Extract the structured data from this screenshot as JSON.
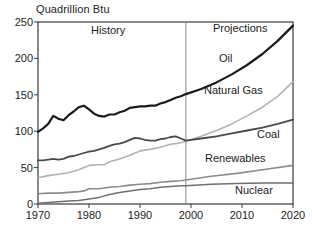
{
  "chart_data": {
    "type": "line",
    "title": "Quadrillion Btu",
    "ylabel": "Quadrillion Btu",
    "xlabel": "",
    "xlim": [
      1970,
      2020
    ],
    "ylim": [
      0,
      250
    ],
    "x_ticks": [
      "1970",
      "1980",
      "1990",
      "2000",
      "2010",
      "2020"
    ],
    "y_ticks": [
      "0",
      "50",
      "100",
      "150",
      "200",
      "250"
    ],
    "grid": false,
    "legend": "inline-labels",
    "divider_year": 1999,
    "regions": {
      "left": "History",
      "right": "Projections"
    },
    "axis_color": "#3a3a3a",
    "divider_color": "#848484",
    "series": [
      {
        "name": "Oil",
        "color": "#1a1a1a",
        "width": 2.2,
        "points": [
          [
            1970,
            99
          ],
          [
            1971,
            104
          ],
          [
            1972,
            110
          ],
          [
            1973,
            121
          ],
          [
            1974,
            117
          ],
          [
            1975,
            115
          ],
          [
            1976,
            122
          ],
          [
            1977,
            127
          ],
          [
            1978,
            133
          ],
          [
            1979,
            135
          ],
          [
            1980,
            130
          ],
          [
            1981,
            124
          ],
          [
            1982,
            121
          ],
          [
            1983,
            120
          ],
          [
            1984,
            123
          ],
          [
            1985,
            123
          ],
          [
            1986,
            126
          ],
          [
            1987,
            128
          ],
          [
            1988,
            132
          ],
          [
            1989,
            133
          ],
          [
            1990,
            134
          ],
          [
            1991,
            134
          ],
          [
            1992,
            135
          ],
          [
            1993,
            135
          ],
          [
            1994,
            138
          ],
          [
            1995,
            140
          ],
          [
            1996,
            143
          ],
          [
            1997,
            146
          ],
          [
            1998,
            148
          ],
          [
            1999,
            151
          ],
          [
            2002,
            158
          ],
          [
            2005,
            167
          ],
          [
            2008,
            178
          ],
          [
            2011,
            191
          ],
          [
            2014,
            206
          ],
          [
            2017,
            224
          ],
          [
            2020,
            245
          ]
        ]
      },
      {
        "name": "Natural Gas",
        "color": "#b3b3b3",
        "width": 1.6,
        "points": [
          [
            1970,
            36
          ],
          [
            1972,
            39
          ],
          [
            1974,
            41
          ],
          [
            1976,
            43
          ],
          [
            1978,
            47
          ],
          [
            1980,
            53
          ],
          [
            1982,
            54
          ],
          [
            1983,
            54
          ],
          [
            1984,
            58
          ],
          [
            1986,
            62
          ],
          [
            1988,
            67
          ],
          [
            1990,
            73
          ],
          [
            1992,
            75
          ],
          [
            1994,
            78
          ],
          [
            1996,
            82
          ],
          [
            1997,
            83
          ],
          [
            1998,
            84
          ],
          [
            1999,
            86
          ],
          [
            2002,
            93
          ],
          [
            2005,
            101
          ],
          [
            2008,
            110
          ],
          [
            2011,
            121
          ],
          [
            2014,
            133
          ],
          [
            2017,
            148
          ],
          [
            2020,
            168
          ]
        ]
      },
      {
        "name": "Coal",
        "color": "#4a4a4a",
        "width": 1.8,
        "points": [
          [
            1970,
            60
          ],
          [
            1971,
            60
          ],
          [
            1972,
            61
          ],
          [
            1973,
            62
          ],
          [
            1974,
            61
          ],
          [
            1975,
            62
          ],
          [
            1976,
            65
          ],
          [
            1977,
            66
          ],
          [
            1978,
            68
          ],
          [
            1979,
            70
          ],
          [
            1980,
            72
          ],
          [
            1981,
            73
          ],
          [
            1982,
            75
          ],
          [
            1983,
            77
          ],
          [
            1984,
            80
          ],
          [
            1985,
            82
          ],
          [
            1986,
            83
          ],
          [
            1987,
            85
          ],
          [
            1988,
            88
          ],
          [
            1989,
            91
          ],
          [
            1990,
            90
          ],
          [
            1991,
            88
          ],
          [
            1992,
            87
          ],
          [
            1993,
            87
          ],
          [
            1994,
            89
          ],
          [
            1995,
            90
          ],
          [
            1996,
            92
          ],
          [
            1997,
            93
          ],
          [
            1998,
            90
          ],
          [
            1999,
            87
          ],
          [
            2002,
            90
          ],
          [
            2005,
            93
          ],
          [
            2008,
            97
          ],
          [
            2011,
            101
          ],
          [
            2014,
            105
          ],
          [
            2017,
            110
          ],
          [
            2020,
            116
          ]
        ]
      },
      {
        "name": "Renewables",
        "color": "#8c8c8c",
        "width": 1.6,
        "points": [
          [
            1970,
            14
          ],
          [
            1972,
            15
          ],
          [
            1974,
            15
          ],
          [
            1976,
            16
          ],
          [
            1978,
            17
          ],
          [
            1979,
            18
          ],
          [
            1980,
            21
          ],
          [
            1982,
            21
          ],
          [
            1984,
            23
          ],
          [
            1986,
            24
          ],
          [
            1988,
            26
          ],
          [
            1990,
            27
          ],
          [
            1992,
            28
          ],
          [
            1994,
            30
          ],
          [
            1996,
            31
          ],
          [
            1998,
            32
          ],
          [
            1999,
            33
          ],
          [
            2004,
            38
          ],
          [
            2009,
            42
          ],
          [
            2014,
            47
          ],
          [
            2020,
            53
          ]
        ]
      },
      {
        "name": "Nuclear",
        "color": "#707070",
        "width": 1.5,
        "points": [
          [
            1970,
            1
          ],
          [
            1972,
            2
          ],
          [
            1974,
            3
          ],
          [
            1976,
            4
          ],
          [
            1978,
            5
          ],
          [
            1980,
            7
          ],
          [
            1982,
            9
          ],
          [
            1984,
            13
          ],
          [
            1986,
            16
          ],
          [
            1988,
            18
          ],
          [
            1990,
            20
          ],
          [
            1992,
            21
          ],
          [
            1994,
            23
          ],
          [
            1996,
            24
          ],
          [
            1998,
            25
          ],
          [
            1999,
            25
          ],
          [
            2004,
            27
          ],
          [
            2009,
            28
          ],
          [
            2014,
            29
          ],
          [
            2020,
            29
          ]
        ]
      }
    ]
  }
}
